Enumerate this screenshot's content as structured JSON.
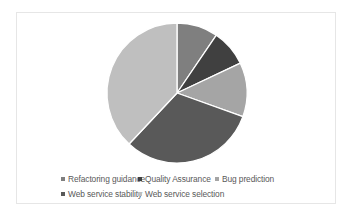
{
  "chart_data": {
    "type": "pie",
    "title": "",
    "start_angle_deg": 0,
    "direction": "clockwise",
    "categories": [
      "Refactoring guidance",
      "Quality Assurance",
      "Bug prediction",
      "Web service stability",
      "Web service selection"
    ],
    "values": [
      9.5,
      8.5,
      12.5,
      31.5,
      38.0
    ],
    "unit": "%",
    "colors": [
      "#7f7f7f",
      "#404040",
      "#a5a5a5",
      "#595959",
      "#bfbfbf"
    ],
    "legend_position": "bottom",
    "data_labels": false
  },
  "legend": {
    "items": [
      {
        "label": "Refactoring guidance",
        "color": "#7f7f7f"
      },
      {
        "label": "Quality Assurance",
        "color": "#404040"
      },
      {
        "label": "Bug prediction",
        "color": "#a5a5a5"
      },
      {
        "label": "Web service stability",
        "color": "#595959"
      },
      {
        "label": "Web service selection",
        "color": "#bfbfbf"
      }
    ]
  }
}
